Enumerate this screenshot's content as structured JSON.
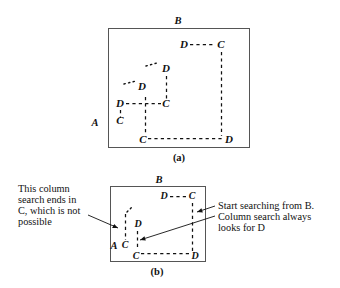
{
  "figure": {
    "panels": [
      {
        "id": "a",
        "caption": "(a)",
        "corner_labels": {
          "top": "B",
          "left": "A"
        },
        "nodes": [
          {
            "name": "a-d-top-right",
            "label": "D",
            "x": 184,
            "y": 48
          },
          {
            "name": "a-c-top-right",
            "label": "C",
            "x": 221,
            "y": 48
          },
          {
            "name": "a-d-upper-mid",
            "label": "D",
            "x": 161,
            "y": 72
          },
          {
            "name": "a-d-left-mid",
            "label": "D",
            "x": 141,
            "y": 90
          },
          {
            "name": "a-d-cross-left",
            "label": "D",
            "x": 120,
            "y": 107
          },
          {
            "name": "a-c-cross-right",
            "label": "C",
            "x": 166,
            "y": 107
          },
          {
            "name": "a-c-lower-left",
            "label": "C",
            "x": 120,
            "y": 123
          },
          {
            "name": "a-c-bottom",
            "label": "C",
            "x": 142,
            "y": 142
          },
          {
            "name": "a-d-bottom-right",
            "label": "D",
            "x": 229,
            "y": 142
          }
        ]
      },
      {
        "id": "b",
        "caption": "(b)",
        "corner_labels": {
          "top": "B",
          "left": "A"
        },
        "nodes": [
          {
            "name": "b-d-top",
            "label": "D",
            "x": 164,
            "y": 199
          },
          {
            "name": "b-c-top-right",
            "label": "C",
            "x": 192,
            "y": 199
          },
          {
            "name": "b-d-mid",
            "label": "D",
            "x": 137,
            "y": 227
          },
          {
            "name": "b-c-left",
            "label": "C",
            "x": 125,
            "y": 246
          },
          {
            "name": "b-c-bottom",
            "label": "C",
            "x": 135,
            "y": 257
          },
          {
            "name": "b-d-bottom-right",
            "label": "D",
            "x": 194,
            "y": 257
          }
        ]
      }
    ],
    "annotations": [
      {
        "name": "annotation-left",
        "lines": [
          "This column",
          "search ends in",
          "C, which is not",
          "possible"
        ]
      },
      {
        "name": "annotation-right",
        "lines": [
          "Start searching from B.",
          "Column search always",
          "looks for D"
        ]
      }
    ]
  },
  "colors": {
    "ink": "#111111",
    "box_stroke": "#555555",
    "background": "#ffffff"
  }
}
